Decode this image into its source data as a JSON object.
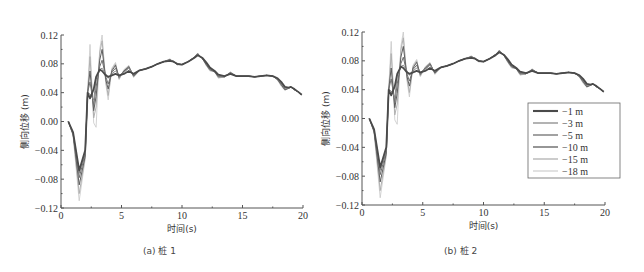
{
  "figure": {
    "panels": [
      {
        "id": "a",
        "caption": "(a) 桩 1"
      },
      {
        "id": "b",
        "caption": "(b) 桩 2"
      }
    ]
  },
  "chart_data": [
    {
      "type": "line",
      "title": "(a) 桩 1",
      "xlabel": "时间(s)",
      "ylabel": "侧向位移 (m)",
      "xlim": [
        0,
        20
      ],
      "ylim": [
        -0.12,
        0.12
      ],
      "xticks": [
        "0",
        "5",
        "10",
        "15",
        "20"
      ],
      "yticks": [
        "0.12",
        "0.08",
        "0.04",
        "0.00",
        "-0.04",
        "-0.08",
        "-0.12"
      ],
      "grid": false,
      "legend_position": "none",
      "x": [
        0.6,
        1.0,
        1.5,
        2.0,
        2.2,
        2.4,
        2.7,
        2.9,
        3.2,
        3.4,
        3.7,
        3.9,
        4.2,
        4.5,
        4.8,
        5.2,
        5.6,
        6.0,
        6.5,
        7.0,
        7.5,
        8.0,
        8.5,
        9.0,
        9.3,
        9.6,
        10.0,
        10.5,
        11.0,
        11.3,
        11.7,
        12.0,
        12.3,
        12.7,
        13.0,
        13.5,
        14.0,
        14.5,
        15.0,
        15.5,
        16.0,
        16.5,
        17.0,
        17.5,
        17.9,
        18.2,
        18.5,
        18.8,
        19.0,
        19.3,
        19.6,
        19.9
      ],
      "series": [
        {
          "name": "-1 m",
          "values": [
            0.0,
            -0.015,
            -0.068,
            -0.04,
            0.04,
            0.032,
            0.045,
            0.062,
            0.072,
            0.07,
            0.064,
            0.062,
            0.064,
            0.066,
            0.064,
            0.066,
            0.07,
            0.066,
            0.071,
            0.073,
            0.076,
            0.08,
            0.083,
            0.084,
            0.083,
            0.08,
            0.079,
            0.083,
            0.088,
            0.092,
            0.088,
            0.082,
            0.075,
            0.07,
            0.065,
            0.063,
            0.066,
            0.063,
            0.063,
            0.063,
            0.062,
            0.063,
            0.064,
            0.063,
            0.06,
            0.055,
            0.048,
            0.047,
            0.048,
            0.045,
            0.041,
            0.037
          ]
        },
        {
          "name": "-3 m",
          "values": [
            0.0,
            -0.016,
            -0.072,
            -0.042,
            0.04,
            0.038,
            0.03,
            0.058,
            0.072,
            0.074,
            0.066,
            0.06,
            0.066,
            0.07,
            0.064,
            0.068,
            0.074,
            0.065,
            0.071,
            0.073,
            0.076,
            0.08,
            0.083,
            0.085,
            0.084,
            0.08,
            0.079,
            0.083,
            0.088,
            0.093,
            0.088,
            0.081,
            0.074,
            0.07,
            0.064,
            0.062,
            0.067,
            0.063,
            0.063,
            0.063,
            0.062,
            0.063,
            0.064,
            0.063,
            0.059,
            0.053,
            0.046,
            0.046,
            0.048,
            0.044,
            0.041,
            0.037
          ]
        },
        {
          "name": "-5 m",
          "values": [
            0.0,
            -0.017,
            -0.078,
            -0.045,
            0.04,
            0.055,
            0.022,
            0.048,
            0.076,
            0.085,
            0.062,
            0.052,
            0.068,
            0.074,
            0.063,
            0.069,
            0.075,
            0.064,
            0.071,
            0.073,
            0.076,
            0.08,
            0.083,
            0.085,
            0.083,
            0.08,
            0.079,
            0.083,
            0.088,
            0.093,
            0.087,
            0.08,
            0.073,
            0.07,
            0.063,
            0.062,
            0.067,
            0.063,
            0.063,
            0.063,
            0.062,
            0.063,
            0.064,
            0.063,
            0.059,
            0.052,
            0.045,
            0.046,
            0.048,
            0.044,
            0.041,
            0.037
          ]
        },
        {
          "name": "-10 m",
          "values": [
            0.0,
            -0.018,
            -0.088,
            -0.048,
            0.04,
            0.07,
            0.015,
            0.035,
            0.085,
            0.1,
            0.058,
            0.045,
            0.07,
            0.078,
            0.061,
            0.07,
            0.076,
            0.063,
            0.071,
            0.073,
            0.076,
            0.08,
            0.083,
            0.086,
            0.083,
            0.079,
            0.079,
            0.083,
            0.089,
            0.094,
            0.087,
            0.079,
            0.072,
            0.069,
            0.062,
            0.062,
            0.068,
            0.063,
            0.063,
            0.063,
            0.062,
            0.063,
            0.064,
            0.063,
            0.058,
            0.051,
            0.044,
            0.046,
            0.048,
            0.044,
            0.041,
            0.037
          ]
        },
        {
          "name": "-15 m",
          "values": [
            0.0,
            -0.019,
            -0.1,
            -0.05,
            0.04,
            0.09,
            0.005,
            0.02,
            0.095,
            0.112,
            0.055,
            0.036,
            0.072,
            0.08,
            0.059,
            0.071,
            0.077,
            0.062,
            0.071,
            0.073,
            0.076,
            0.08,
            0.083,
            0.086,
            0.083,
            0.079,
            0.079,
            0.083,
            0.089,
            0.094,
            0.087,
            0.078,
            0.071,
            0.069,
            0.061,
            0.062,
            0.068,
            0.063,
            0.063,
            0.063,
            0.062,
            0.063,
            0.064,
            0.063,
            0.058,
            0.05,
            0.044,
            0.046,
            0.048,
            0.044,
            0.041,
            0.037
          ]
        },
        {
          "name": "-18 m",
          "values": [
            0.0,
            -0.02,
            -0.11,
            -0.052,
            0.04,
            0.107,
            -0.002,
            -0.008,
            0.1,
            0.12,
            0.052,
            0.03,
            0.074,
            0.082,
            0.058,
            0.072,
            0.078,
            0.061,
            0.071,
            0.073,
            0.076,
            0.08,
            0.083,
            0.087,
            0.083,
            0.079,
            0.079,
            0.083,
            0.089,
            0.095,
            0.087,
            0.078,
            0.07,
            0.069,
            0.06,
            0.062,
            0.069,
            0.063,
            0.063,
            0.063,
            0.062,
            0.063,
            0.064,
            0.063,
            0.057,
            0.049,
            0.043,
            0.046,
            0.048,
            0.044,
            0.041,
            0.037
          ]
        }
      ]
    },
    {
      "type": "line",
      "title": "(b) 桩 2",
      "xlabel": "时间(s)",
      "ylabel": "侧向位移 (m)",
      "xlim": [
        0,
        20
      ],
      "ylim": [
        -0.12,
        0.12
      ],
      "xticks": [
        "0",
        "5",
        "10",
        "15",
        "20"
      ],
      "yticks": [
        "0.12",
        "0.08",
        "0.04",
        "0.00",
        "-0.04",
        "-0.08",
        "-0.12"
      ],
      "grid": false,
      "legend_position": "right-middle",
      "legend": [
        "-1 m",
        "-3 m",
        "-5 m",
        "-10 m",
        "-15 m",
        "-18 m"
      ],
      "x": [
        0.6,
        1.0,
        1.5,
        2.0,
        2.2,
        2.4,
        2.7,
        2.9,
        3.2,
        3.4,
        3.7,
        3.9,
        4.2,
        4.5,
        4.8,
        5.2,
        5.6,
        6.0,
        6.5,
        7.0,
        7.5,
        8.0,
        8.5,
        9.0,
        9.3,
        9.6,
        10.0,
        10.5,
        11.0,
        11.3,
        11.7,
        12.0,
        12.3,
        12.7,
        13.0,
        13.5,
        14.0,
        14.5,
        15.0,
        15.5,
        16.0,
        16.5,
        17.0,
        17.5,
        17.9,
        18.2,
        18.5,
        18.8,
        19.0,
        19.3,
        19.6,
        19.9
      ],
      "series": [
        {
          "name": "-1 m",
          "values": [
            0.0,
            -0.015,
            -0.068,
            -0.04,
            0.04,
            0.032,
            0.045,
            0.062,
            0.072,
            0.07,
            0.064,
            0.062,
            0.064,
            0.066,
            0.064,
            0.066,
            0.07,
            0.066,
            0.071,
            0.073,
            0.076,
            0.08,
            0.083,
            0.084,
            0.083,
            0.08,
            0.079,
            0.083,
            0.088,
            0.092,
            0.088,
            0.082,
            0.075,
            0.07,
            0.065,
            0.063,
            0.066,
            0.063,
            0.063,
            0.063,
            0.062,
            0.063,
            0.064,
            0.063,
            0.06,
            0.055,
            0.048,
            0.047,
            0.048,
            0.045,
            0.041,
            0.037
          ]
        },
        {
          "name": "-3 m",
          "values": [
            0.0,
            -0.016,
            -0.072,
            -0.042,
            0.04,
            0.038,
            0.03,
            0.058,
            0.072,
            0.074,
            0.066,
            0.06,
            0.066,
            0.07,
            0.064,
            0.068,
            0.074,
            0.065,
            0.071,
            0.073,
            0.076,
            0.08,
            0.083,
            0.085,
            0.084,
            0.08,
            0.079,
            0.083,
            0.088,
            0.093,
            0.088,
            0.081,
            0.074,
            0.07,
            0.064,
            0.062,
            0.067,
            0.063,
            0.063,
            0.063,
            0.062,
            0.063,
            0.064,
            0.063,
            0.059,
            0.053,
            0.046,
            0.046,
            0.048,
            0.044,
            0.041,
            0.037
          ]
        },
        {
          "name": "-5 m",
          "values": [
            0.0,
            -0.017,
            -0.078,
            -0.045,
            0.04,
            0.055,
            0.022,
            0.048,
            0.076,
            0.085,
            0.062,
            0.052,
            0.068,
            0.074,
            0.063,
            0.069,
            0.075,
            0.064,
            0.071,
            0.073,
            0.076,
            0.08,
            0.083,
            0.085,
            0.083,
            0.08,
            0.079,
            0.083,
            0.088,
            0.093,
            0.087,
            0.08,
            0.073,
            0.07,
            0.063,
            0.062,
            0.067,
            0.063,
            0.063,
            0.063,
            0.062,
            0.063,
            0.064,
            0.063,
            0.059,
            0.052,
            0.045,
            0.046,
            0.048,
            0.044,
            0.041,
            0.037
          ]
        },
        {
          "name": "-10 m",
          "values": [
            0.0,
            -0.018,
            -0.088,
            -0.048,
            0.04,
            0.07,
            0.015,
            0.035,
            0.085,
            0.1,
            0.058,
            0.045,
            0.07,
            0.078,
            0.061,
            0.07,
            0.076,
            0.063,
            0.071,
            0.073,
            0.076,
            0.08,
            0.083,
            0.086,
            0.083,
            0.079,
            0.079,
            0.083,
            0.089,
            0.094,
            0.087,
            0.079,
            0.072,
            0.069,
            0.062,
            0.062,
            0.068,
            0.063,
            0.063,
            0.063,
            0.062,
            0.063,
            0.064,
            0.063,
            0.058,
            0.051,
            0.044,
            0.046,
            0.048,
            0.044,
            0.041,
            0.037
          ]
        },
        {
          "name": "-15 m",
          "values": [
            0.0,
            -0.019,
            -0.1,
            -0.05,
            0.04,
            0.09,
            0.005,
            0.02,
            0.095,
            0.112,
            0.055,
            0.036,
            0.072,
            0.08,
            0.059,
            0.071,
            0.077,
            0.062,
            0.071,
            0.073,
            0.076,
            0.08,
            0.083,
            0.086,
            0.083,
            0.079,
            0.079,
            0.083,
            0.089,
            0.094,
            0.087,
            0.078,
            0.071,
            0.069,
            0.061,
            0.062,
            0.068,
            0.063,
            0.063,
            0.063,
            0.062,
            0.063,
            0.064,
            0.063,
            0.058,
            0.05,
            0.044,
            0.046,
            0.048,
            0.044,
            0.041,
            0.037
          ]
        },
        {
          "name": "-18 m",
          "values": [
            0.0,
            -0.02,
            -0.11,
            -0.052,
            0.04,
            0.107,
            -0.002,
            -0.008,
            0.1,
            0.12,
            0.052,
            0.03,
            0.074,
            0.082,
            0.058,
            0.072,
            0.078,
            0.061,
            0.071,
            0.073,
            0.076,
            0.08,
            0.083,
            0.087,
            0.083,
            0.079,
            0.079,
            0.083,
            0.089,
            0.095,
            0.087,
            0.078,
            0.07,
            0.069,
            0.06,
            0.062,
            0.069,
            0.063,
            0.063,
            0.063,
            0.062,
            0.063,
            0.064,
            0.063,
            0.057,
            0.049,
            0.043,
            0.046,
            0.048,
            0.044,
            0.041,
            0.037
          ]
        }
      ]
    }
  ],
  "style": {
    "series_colors": [
      "#4a4a4a",
      "#8a8a8a",
      "#707070",
      "#5e5e5e",
      "#b0b0b0",
      "#c8c8c8"
    ],
    "series_widths": [
      1.8,
      1.0,
      1.0,
      1.0,
      1.0,
      0.8
    ],
    "axis_color": "#555555"
  }
}
